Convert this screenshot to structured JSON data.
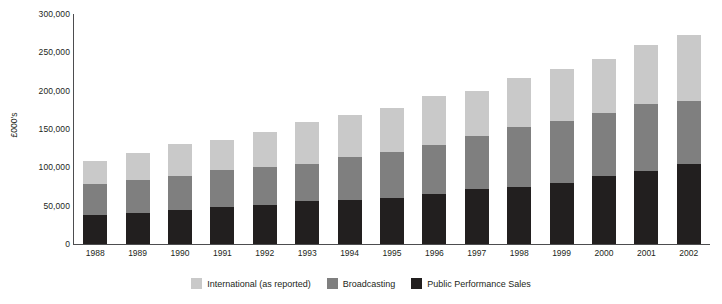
{
  "chart_data": {
    "type": "bar",
    "stacked": true,
    "title": "",
    "xlabel": "",
    "ylabel": "£000's",
    "ylim": [
      0,
      300000
    ],
    "ytick_labels": [
      "300,000",
      "250,000",
      "200,000",
      "150,000",
      "100,000",
      "50,000",
      "0"
    ],
    "ytick_values": [
      300000,
      250000,
      200000,
      150000,
      100000,
      50000,
      0
    ],
    "grid": false,
    "legend_position": "bottom",
    "categories": [
      "1988",
      "1989",
      "1990",
      "1991",
      "1992",
      "1993",
      "1994",
      "1995",
      "1996",
      "1997",
      "1998",
      "1999",
      "2000",
      "2001",
      "2002"
    ],
    "series": [
      {
        "name": "Public Performance Sales",
        "color": "#221f1f",
        "values": [
          38000,
          41000,
          45000,
          48000,
          51000,
          56000,
          57000,
          60000,
          65000,
          72000,
          75000,
          80000,
          89000,
          95000,
          104000
        ]
      },
      {
        "name": "Broadcasting",
        "color": "#7f7f7f",
        "values": [
          40000,
          42000,
          44000,
          49000,
          50000,
          49000,
          56000,
          60000,
          64000,
          69000,
          78000,
          81000,
          82000,
          87000,
          83000
        ]
      },
      {
        "name": "International (as reported)",
        "color": "#c9c9c9",
        "values": [
          30000,
          36000,
          41000,
          39000,
          45000,
          54000,
          55000,
          58000,
          64000,
          59000,
          63000,
          67000,
          71000,
          77000,
          86000
        ]
      }
    ],
    "totals": [
      108000,
      119000,
      130000,
      136000,
      146000,
      159000,
      168000,
      178000,
      193000,
      200000,
      216000,
      228000,
      242000,
      259000,
      273000
    ]
  },
  "legend": {
    "items": [
      {
        "label": "International (as reported)",
        "color": "#c9c9c9"
      },
      {
        "label": "Broadcasting",
        "color": "#7f7f7f"
      },
      {
        "label": "Public Performance Sales",
        "color": "#221f1f"
      }
    ]
  }
}
